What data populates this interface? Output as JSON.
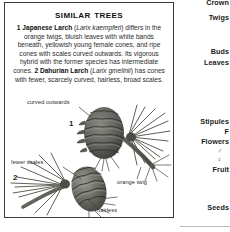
{
  "panel": {
    "title": "Similar Trees",
    "paragraph_runs": [
      {
        "text": "1 Japanese Larch ",
        "style": "bold"
      },
      {
        "text": "(",
        "style": "normal"
      },
      {
        "text": "Larix kaempferi",
        "style": "italic"
      },
      {
        "text": ") differs in the orange twigs, bluish leaves with white bands beneath, yellowish young female cones, and ripe cones with scales curved outwards. Its vigorous hybrid with the former species has intermediate cones. ",
        "style": "normal"
      },
      {
        "text": "2 Dahurian Larch ",
        "style": "bold"
      },
      {
        "text": "(",
        "style": "normal"
      },
      {
        "text": "Larix gmelinii",
        "style": "italic"
      },
      {
        "text": ") has cones with fewer, scarcely curved, hairless, broad scales.",
        "style": "normal"
      }
    ],
    "plain_text": "1 Japanese Larch (Larix kaempferi) differs in the orange twigs, bluish leaves with white bands beneath, yellowish young female cones, and ripe cones with scales curved outwards. Its vigorous hybrid with the former species has intermediate cones. 2 Dahurian Larch (Larix gmelinii) has cones with fewer, scarcely curved, hairless, broad scales."
  },
  "illustration": {
    "callouts": [
      {
        "id": "curved-outwards",
        "text": "curved outwards"
      },
      {
        "id": "fewer-scales",
        "text": "fewer scales"
      },
      {
        "id": "orange-twig",
        "text": "orange twig"
      },
      {
        "id": "hairless",
        "text": "hairless"
      }
    ],
    "numbers": [
      {
        "id": "one",
        "text": "1"
      },
      {
        "id": "two",
        "text": "2"
      }
    ]
  },
  "right_column": {
    "labels": [
      {
        "id": "crown",
        "text": "Crown"
      },
      {
        "id": "twigs",
        "text": "Twigs"
      },
      {
        "id": "buds",
        "text": "Buds"
      },
      {
        "id": "leaves",
        "text": "Leaves"
      },
      {
        "id": "stipules",
        "text": "Stipules"
      },
      {
        "id": "f",
        "text": "F"
      },
      {
        "id": "flowers",
        "text": "Flowers"
      },
      {
        "id": "fruit",
        "text": "Fruit"
      },
      {
        "id": "seeds",
        "text": "Seeds"
      }
    ],
    "symbols": [
      {
        "id": "male",
        "text": "♂"
      },
      {
        "id": "female",
        "text": "♀"
      }
    ]
  },
  "colors": {
    "border": "#3a3a3a",
    "text": "#2b2b2b",
    "heading": "#111111",
    "rule": "#b9b9b9",
    "page_background": "#ffffff"
  }
}
